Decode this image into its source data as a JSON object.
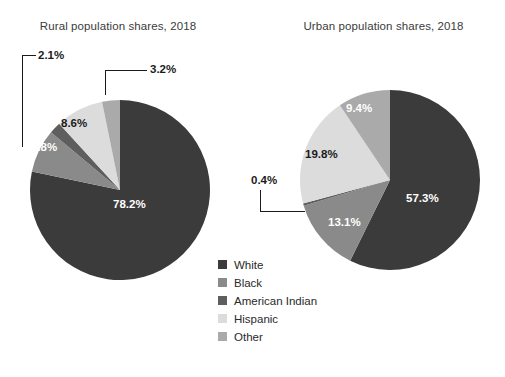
{
  "figure": {
    "background_color": "#ffffff",
    "text_color": "#231f20"
  },
  "charts": {
    "rural": {
      "title": "Rural population shares, 2018",
      "labels": {
        "white": "78.2%",
        "black": "7.8%",
        "american_indian": "2.1%",
        "hispanic": "8.6%",
        "other": "3.2%"
      }
    },
    "urban": {
      "title": "Urban population shares, 2018",
      "labels": {
        "white": "57.3%",
        "black": "13.1%",
        "american_indian": "0.4%",
        "hispanic": "19.8%",
        "other": "9.4%"
      }
    }
  },
  "legend": {
    "items": [
      {
        "label": "White",
        "color": "#3b3b3b"
      },
      {
        "label": "Black",
        "color": "#8a8a8a"
      },
      {
        "label": "American Indian",
        "color": "#5e5e5e"
      },
      {
        "label": "Hispanic",
        "color": "#dcdcdc"
      },
      {
        "label": "Other",
        "color": "#aaaaaa"
      }
    ]
  },
  "chart_data": [
    {
      "type": "pie",
      "title": "Rural population shares, 2018",
      "categories": [
        "White",
        "Black",
        "American Indian",
        "Hispanic",
        "Other"
      ],
      "values": [
        78.2,
        7.8,
        2.1,
        8.6,
        3.2
      ],
      "labels": [
        "78.2%",
        "7.8%",
        "2.1%",
        "8.6%",
        "3.2%"
      ],
      "colors": [
        "#3b3b3b",
        "#8a8a8a",
        "#5e5e5e",
        "#dcdcdc",
        "#aaaaaa"
      ],
      "units": "percent",
      "start_angle_deg": 0,
      "direction": "clockwise",
      "legend_position": "center-bottom",
      "grid": false
    },
    {
      "type": "pie",
      "title": "Urban population shares, 2018",
      "categories": [
        "White",
        "Black",
        "American Indian",
        "Hispanic",
        "Other"
      ],
      "values": [
        57.3,
        13.1,
        0.4,
        19.8,
        9.4
      ],
      "labels": [
        "57.3%",
        "13.1%",
        "0.4%",
        "19.8%",
        "9.4%"
      ],
      "colors": [
        "#3b3b3b",
        "#8a8a8a",
        "#5e5e5e",
        "#dcdcdc",
        "#aaaaaa"
      ],
      "units": "percent",
      "start_angle_deg": 0,
      "direction": "clockwise",
      "legend_position": "center-bottom",
      "grid": false
    }
  ]
}
